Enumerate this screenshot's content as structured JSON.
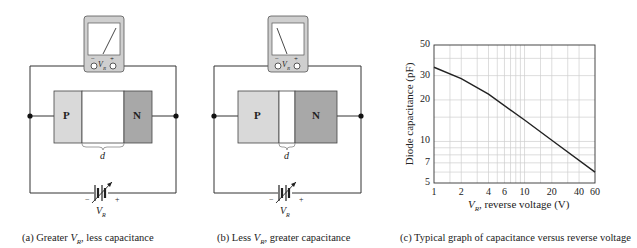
{
  "panel_a": {
    "p_label": "P",
    "n_label": "N",
    "width_label": "d",
    "meter_label": "V",
    "meter_sub": "R",
    "meter_minus": "−",
    "meter_plus": "+",
    "battery_minus": "−",
    "battery_plus": "+",
    "battery_label": "V",
    "battery_sub": "R",
    "caption_prefix": "(a) Greater ",
    "caption_v": "V",
    "caption_sub": "R",
    "caption_suffix": ", less capacitance"
  },
  "panel_b": {
    "p_label": "P",
    "n_label": "N",
    "width_label": "d",
    "meter_label": "V",
    "meter_sub": "R",
    "meter_minus": "−",
    "meter_plus": "+",
    "battery_minus": "−",
    "battery_plus": "+",
    "battery_label": "V",
    "battery_sub": "R",
    "caption_prefix": "(b) Less ",
    "caption_v": "V",
    "caption_sub": "R",
    "caption_suffix": ", greater capacitance"
  },
  "panel_c": {
    "caption": "(c) Typical graph of capacitance versus reverse voltage"
  },
  "chart_data": {
    "type": "line",
    "title": "Typical graph of capacitance versus reverse voltage",
    "xlabel_v": "V",
    "xlabel_sub": "R",
    "xlabel_rest": ", reverse voltage (V)",
    "ylabel": "Diode capacitance (pF)",
    "xscale": "log",
    "yscale": "log",
    "xlim": [
      1,
      60
    ],
    "ylim": [
      5,
      50
    ],
    "x_ticks": [
      "1",
      "2",
      "4",
      "6",
      "10",
      "20",
      "40",
      "60"
    ],
    "y_ticks": [
      "5",
      "7",
      "10",
      "20",
      "30",
      "50"
    ],
    "grid": true,
    "series": [
      {
        "name": "Diode capacitance",
        "x": [
          1,
          2,
          4,
          10,
          20,
          60
        ],
        "values": [
          34.5,
          28.5,
          22,
          14.3,
          10.2,
          6.0
        ]
      }
    ]
  }
}
